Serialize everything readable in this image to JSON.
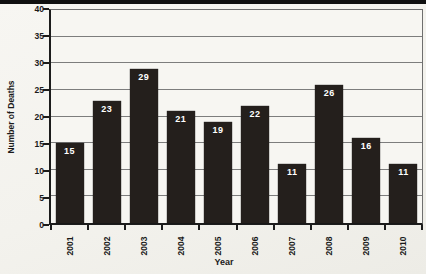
{
  "page": {
    "background_color": "#f4f3ef",
    "top_rule_color": "#101010"
  },
  "chart_data": {
    "type": "bar",
    "title": "",
    "xlabel": "Year",
    "ylabel": "Number of Deaths",
    "categories": [
      "2001",
      "2002",
      "2003",
      "2004",
      "2005",
      "2006",
      "2007",
      "2008",
      "2009",
      "2010"
    ],
    "values": [
      15,
      23,
      29,
      21,
      19,
      22,
      11,
      26,
      16,
      11
    ],
    "ylim": [
      0,
      40
    ],
    "yticks": [
      0,
      5,
      10,
      15,
      20,
      25,
      30,
      35,
      40
    ],
    "grid": true,
    "legend": "none",
    "bar_color": "#241f1c",
    "bar_label_color": "#ffffff",
    "grid_color": "#7d7d7d",
    "axis_color": "#1c1c1c",
    "plot_border_color": "#6f6f6f",
    "tick_label_color": "#1a1a1a"
  }
}
